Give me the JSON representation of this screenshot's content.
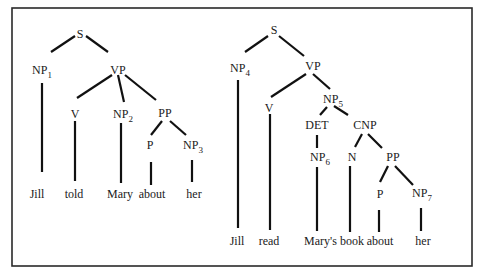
{
  "figure": {
    "colors": {
      "line": "#111111",
      "text": "#1a1a1a",
      "frame": "#2a2a2a",
      "background": "#ffffff"
    }
  },
  "tree_left": {
    "sentence": "Jill told Mary about her",
    "nodes": {
      "S": {
        "label": "S",
        "sub": ""
      },
      "NP1": {
        "label": "NP",
        "sub": "1"
      },
      "VP": {
        "label": "VP",
        "sub": ""
      },
      "V": {
        "label": "V",
        "sub": ""
      },
      "NP2": {
        "label": "NP",
        "sub": "2"
      },
      "PP": {
        "label": "PP",
        "sub": ""
      },
      "P": {
        "label": "P",
        "sub": ""
      },
      "NP3": {
        "label": "NP",
        "sub": "3"
      }
    },
    "leaves": [
      "Jill",
      "told",
      "Mary",
      "about",
      "her"
    ]
  },
  "tree_right": {
    "sentence": "Jill read Mary's book about her",
    "nodes": {
      "S": {
        "label": "S",
        "sub": ""
      },
      "NP4": {
        "label": "NP",
        "sub": "4"
      },
      "VP": {
        "label": "VP",
        "sub": ""
      },
      "V": {
        "label": "V",
        "sub": ""
      },
      "NP5": {
        "label": "NP",
        "sub": "5"
      },
      "DET": {
        "label": "DET",
        "sub": ""
      },
      "CNP": {
        "label": "CNP",
        "sub": ""
      },
      "NP6": {
        "label": "NP",
        "sub": "6"
      },
      "N": {
        "label": "N",
        "sub": ""
      },
      "PP": {
        "label": "PP",
        "sub": ""
      },
      "P": {
        "label": "P",
        "sub": ""
      },
      "NP7": {
        "label": "NP",
        "sub": "7"
      }
    },
    "leaves": [
      "Jill",
      "read",
      "Mary's book",
      "about",
      "her"
    ]
  }
}
